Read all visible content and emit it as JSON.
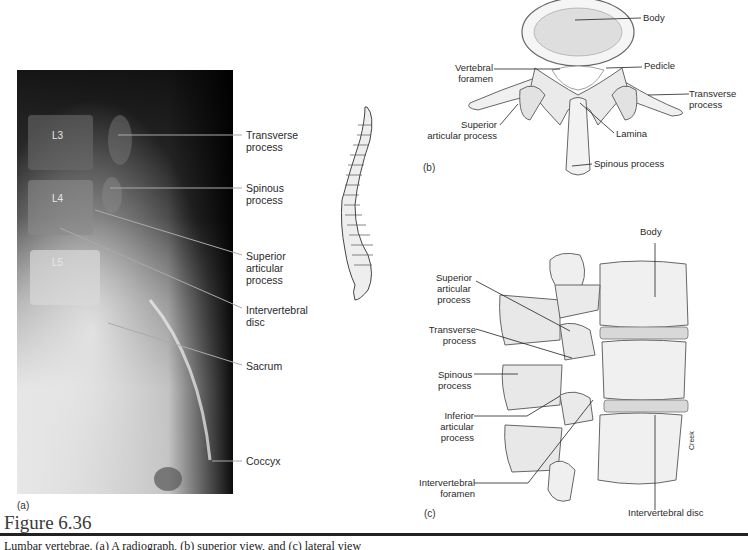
{
  "figure": {
    "heading": "Figure 6.36",
    "caption": "Lumbar vertebrae. (a) A radiograph, (b) superior view, and (c) lateral view"
  },
  "panel_a": {
    "letter": "(a)",
    "vertebra_labels": [
      "L3",
      "L4",
      "L5"
    ],
    "callouts": [
      {
        "line1": "Transverse",
        "line2": "process",
        "line3": ""
      },
      {
        "line1": "Spinous",
        "line2": "process",
        "line3": ""
      },
      {
        "line1": "Superior",
        "line2": "articular",
        "line3": "process"
      },
      {
        "line1": "Intervertebral",
        "line2": "disc",
        "line3": ""
      },
      {
        "line1": "Sacrum",
        "line2": "",
        "line3": ""
      },
      {
        "line1": "Coccyx",
        "line2": "",
        "line3": ""
      }
    ]
  },
  "panel_b": {
    "letter": "(b)",
    "callouts": {
      "body": "Body",
      "vertebral_foramen_1": "Vertebral",
      "vertebral_foramen_2": "foramen",
      "pedicle": "Pedicle",
      "transverse_1": "Transverse",
      "transverse_2": "process",
      "superior_1": "Superior",
      "superior_2": "articular process",
      "lamina": "Lamina",
      "spinous": "Spinous process"
    }
  },
  "panel_c": {
    "letter": "(c)",
    "artist_signature": "Creek",
    "callouts": {
      "body": "Body",
      "superior_1": "Superior",
      "superior_2": "articular",
      "superior_3": "process",
      "transverse_1": "Transverse",
      "transverse_2": "process",
      "spinous_1": "Spinous",
      "spinous_2": "process",
      "inferior_1": "Inferior",
      "inferior_2": "articular",
      "inferior_3": "process",
      "foramen_1": "Intervertebral",
      "foramen_2": "foramen",
      "disc": "Intervertebral disc"
    }
  }
}
